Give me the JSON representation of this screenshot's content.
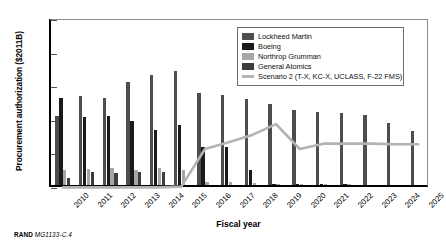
{
  "chart_data": {
    "type": "bar",
    "title": "",
    "xlabel": "Fiscal year",
    "ylabel": "Procurement authorization ($2011B)",
    "ylim": [
      0,
      25
    ],
    "yticks": [
      0,
      5,
      10,
      15,
      20,
      25
    ],
    "grid": false,
    "legend_position": "top-right",
    "categories": [
      "2010",
      "2011",
      "2012",
      "2013",
      "2014",
      "2015",
      "2016",
      "2017",
      "2018",
      "2019",
      "2020",
      "2021",
      "2022",
      "2023",
      "2024",
      "2025"
    ],
    "series": [
      {
        "name": "Lockheed Martin",
        "color": "#4d4d4d",
        "values": [
          10.2,
          13.2,
          13.0,
          15.3,
          16.3,
          17.0,
          13.7,
          13.4,
          12.8,
          12.0,
          11.2,
          10.9,
          10.7,
          10.4,
          9.2,
          8.1
        ]
      },
      {
        "name": "Boeing",
        "color": "#1a1a1a",
        "values": [
          12.9,
          10.1,
          10.2,
          9.6,
          8.2,
          9.0,
          5.7,
          5.7,
          2.2,
          0.15,
          0.05,
          0.05,
          0.05,
          0.0,
          0.0,
          0.0
        ]
      },
      {
        "name": "Northrop Grumman",
        "color": "#a6a6a6",
        "values": [
          2.3,
          2.4,
          2.5,
          2.3,
          2.5,
          2.3,
          0.5,
          0.45,
          0.35,
          0.1,
          0.05,
          0.05,
          0.05,
          0.0,
          0.0,
          0.0
        ]
      },
      {
        "name": "General Atomics",
        "color": "#3d3d3d",
        "values": [
          1.1,
          1.9,
          1.8,
          2.0,
          1.9,
          0.0,
          0.0,
          0.0,
          0.0,
          0.0,
          0.0,
          0.0,
          0.0,
          0.0,
          0.0,
          0.0
        ]
      }
    ],
    "line_series": {
      "name": "Scenario 2 (T-X, KC-X, UCLASS, F-22 FMS)",
      "color": "#b3b3b3",
      "values": [
        0.1,
        0.1,
        0.1,
        0.1,
        0.1,
        0.2,
        5.8,
        6.8,
        7.9,
        9.5,
        5.8,
        6.6,
        6.6,
        6.6,
        6.5,
        6.5
      ]
    }
  },
  "legend": {
    "items": [
      {
        "label": "Lockheed Martin",
        "color": "#4d4d4d",
        "kind": "swatch"
      },
      {
        "label": "Boeing",
        "color": "#1a1a1a",
        "kind": "swatch"
      },
      {
        "label": "Northrop Grumman",
        "color": "#a6a6a6",
        "kind": "swatch"
      },
      {
        "label": "General Atomics",
        "color": "#3d3d3d",
        "kind": "swatch"
      },
      {
        "label": "Scenario 2 (T-X, KC-X, UCLASS, F-22 FMS)",
        "color": "#b3b3b3",
        "kind": "line"
      }
    ]
  },
  "credit": {
    "org": "RAND",
    "figure_number": "MG1133-C.4"
  }
}
